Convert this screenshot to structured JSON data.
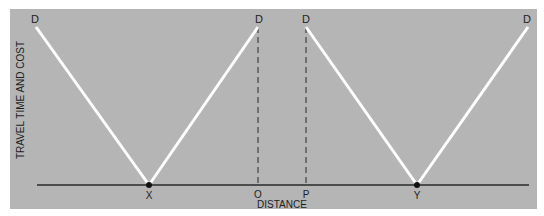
{
  "diagram": {
    "y_axis_label": "TRAVEL TIME AND COST",
    "x_axis_label": "DISTANCE",
    "colors": {
      "panel": "#b5b5b5",
      "background": "#ffffff",
      "cost_line": "#ffffff",
      "axis": "#2a2a2a",
      "text": "#1e1e1e"
    },
    "points": {
      "d1": "D",
      "d2": "D",
      "d3": "D",
      "d4": "D",
      "x": "X",
      "o": "O",
      "p": "P",
      "y": "Y"
    }
  }
}
